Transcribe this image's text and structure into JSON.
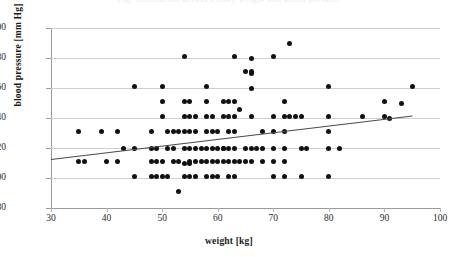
{
  "figure": {
    "cut_caption": "Fig. Correlation between body weight and blood pressure"
  },
  "chart_data": {
    "type": "scatter",
    "title": "",
    "xlabel": "weight [kg]",
    "ylabel": "blood pressure [mm Hg]",
    "xlim": [
      30,
      100
    ],
    "ylim": [
      80,
      200
    ],
    "xticks": [
      30,
      40,
      50,
      60,
      70,
      80,
      90,
      100
    ],
    "yticks": [
      80,
      100,
      120,
      140,
      160,
      180,
      200
    ],
    "grid": "horizontal",
    "legend": "none",
    "marker_color": "#111111",
    "trendline_color": "#4a4a4a",
    "trendline": {
      "type": "linear",
      "x": [
        30,
        95
      ],
      "y": [
        113,
        142
      ]
    },
    "points": [
      [
        35,
        131
      ],
      [
        39,
        131
      ],
      [
        42,
        131
      ],
      [
        35,
        111
      ],
      [
        36,
        111
      ],
      [
        40,
        111
      ],
      [
        42,
        111
      ],
      [
        43,
        120
      ],
      [
        45,
        120
      ],
      [
        45,
        161
      ],
      [
        45,
        101
      ],
      [
        48,
        131
      ],
      [
        48,
        120
      ],
      [
        49,
        120
      ],
      [
        48,
        111
      ],
      [
        49,
        111
      ],
      [
        50,
        111
      ],
      [
        48,
        101
      ],
      [
        49,
        101
      ],
      [
        50,
        101
      ],
      [
        50,
        161
      ],
      [
        50,
        151
      ],
      [
        50,
        141
      ],
      [
        51,
        131
      ],
      [
        52,
        131
      ],
      [
        53,
        131
      ],
      [
        51,
        120
      ],
      [
        52,
        120
      ],
      [
        52,
        111
      ],
      [
        53,
        111
      ],
      [
        51,
        101
      ],
      [
        53,
        91
      ],
      [
        54,
        181
      ],
      [
        54,
        151
      ],
      [
        55,
        151
      ],
      [
        54,
        141
      ],
      [
        55,
        141
      ],
      [
        56,
        141
      ],
      [
        54,
        131
      ],
      [
        55,
        131
      ],
      [
        56,
        131
      ],
      [
        54,
        120
      ],
      [
        55,
        120
      ],
      [
        56,
        120
      ],
      [
        54,
        110
      ],
      [
        55,
        110
      ],
      [
        55,
        111
      ],
      [
        56,
        111
      ],
      [
        54,
        101
      ],
      [
        55,
        101
      ],
      [
        56,
        101
      ],
      [
        58,
        161
      ],
      [
        58,
        151
      ],
      [
        58,
        141
      ],
      [
        59,
        141
      ],
      [
        58,
        131
      ],
      [
        59,
        131
      ],
      [
        60,
        131
      ],
      [
        57,
        120
      ],
      [
        58,
        120
      ],
      [
        59,
        120
      ],
      [
        60,
        120
      ],
      [
        61,
        120
      ],
      [
        57,
        111
      ],
      [
        58,
        111
      ],
      [
        59,
        111
      ],
      [
        60,
        111
      ],
      [
        61,
        111
      ],
      [
        58,
        101
      ],
      [
        59,
        101
      ],
      [
        60,
        101
      ],
      [
        61,
        151
      ],
      [
        62,
        151
      ],
      [
        63,
        151
      ],
      [
        61,
        141
      ],
      [
        62,
        141
      ],
      [
        63,
        141
      ],
      [
        62,
        131
      ],
      [
        63,
        131
      ],
      [
        61,
        120
      ],
      [
        62,
        120
      ],
      [
        63,
        120
      ],
      [
        62,
        111
      ],
      [
        63,
        111
      ],
      [
        64,
        111
      ],
      [
        62,
        101
      ],
      [
        63,
        101
      ],
      [
        63,
        181
      ],
      [
        64,
        146
      ],
      [
        65,
        171
      ],
      [
        66,
        171
      ],
      [
        66,
        170
      ],
      [
        66,
        180
      ],
      [
        66,
        160
      ],
      [
        66,
        141
      ],
      [
        65,
        120
      ],
      [
        66,
        120
      ],
      [
        67,
        120
      ],
      [
        65,
        111
      ],
      [
        66,
        111
      ],
      [
        68,
        131
      ],
      [
        68,
        120
      ],
      [
        68,
        111
      ],
      [
        70,
        181
      ],
      [
        70,
        141
      ],
      [
        70,
        131
      ],
      [
        70,
        120
      ],
      [
        70,
        111
      ],
      [
        70,
        101
      ],
      [
        72,
        151
      ],
      [
        72,
        141
      ],
      [
        73,
        141
      ],
      [
        74,
        141
      ],
      [
        75,
        141
      ],
      [
        72,
        131
      ],
      [
        72,
        120
      ],
      [
        72,
        111
      ],
      [
        72,
        101
      ],
      [
        73,
        190
      ],
      [
        75,
        120
      ],
      [
        76,
        120
      ],
      [
        75,
        101
      ],
      [
        80,
        161
      ],
      [
        80,
        141
      ],
      [
        80,
        131
      ],
      [
        80,
        120
      ],
      [
        82,
        120
      ],
      [
        80,
        101
      ],
      [
        86,
        141
      ],
      [
        90,
        151
      ],
      [
        90,
        141
      ],
      [
        91,
        140
      ],
      [
        93,
        150
      ],
      [
        95,
        161
      ]
    ]
  }
}
